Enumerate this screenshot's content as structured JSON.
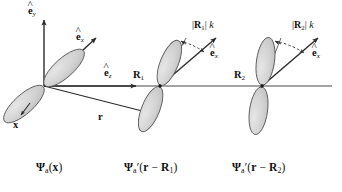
{
  "figure": {
    "background_color": "#ffffff",
    "lobe_fill_color": "#d4d4d4",
    "lobe_stroke_color": "#555555",
    "axis_color": "#4a4a4a",
    "text_color": "#111111"
  },
  "panels": [
    {
      "id": "panel-origin",
      "caption_psi": "Ψ",
      "caption_sub": "a",
      "caption_prime": "",
      "caption_arg": "(x)",
      "caption_full": "Ψa(x)",
      "origin_label": "",
      "orbital_tilt_deg": 42,
      "vectors": [
        {
          "name": "e-hat-y",
          "label_base": "e",
          "label_sub": "y",
          "hat": true
        },
        {
          "name": "e-hat-x",
          "label_base": "e",
          "label_sub": "x",
          "hat": true
        },
        {
          "name": "e-hat-z",
          "label_base": "e",
          "label_sub": "z",
          "hat": true
        },
        {
          "name": "r-vector",
          "label_base": "r",
          "label_sub": "",
          "hat": false
        }
      ],
      "point_labels": [
        {
          "name": "x-point",
          "text": "x"
        }
      ]
    },
    {
      "id": "panel-R1",
      "caption_psi": "Ψ",
      "caption_sub": "a",
      "caption_prime": "′",
      "caption_arg": "(r − R1)",
      "caption_full": "Ψ′a(r − R1)",
      "origin_label": "R",
      "origin_sub": "1",
      "orbital_tilt_deg": 22,
      "annotation": {
        "magnitude": "|R1|",
        "wavevector": "k",
        "display": "|R1| k"
      },
      "vectors": [
        {
          "name": "e-hat-x",
          "label_base": "e",
          "label_sub": "x",
          "hat": true
        }
      ]
    },
    {
      "id": "panel-R2",
      "caption_psi": "Ψ",
      "caption_sub": "a",
      "caption_prime": "′",
      "caption_arg": "(r − R2)",
      "caption_full": "Ψ′a(r − R2)",
      "origin_label": "R",
      "origin_sub": "2",
      "orbital_tilt_deg": 8,
      "annotation": {
        "magnitude": "|R2|",
        "wavevector": "k",
        "display": "|R2| k"
      },
      "vectors": [
        {
          "name": "e-hat-x",
          "label_base": "e",
          "label_sub": "x",
          "hat": true
        }
      ]
    }
  ],
  "labels": {
    "e_base": "e",
    "sub_x": "x",
    "sub_y": "y",
    "sub_z": "z",
    "r_vector": "r",
    "x_point": "x",
    "R_base": "R",
    "sub_1": "1",
    "sub_2": "2",
    "k_symbol": "k",
    "bar": "|",
    "psi": "Ψ",
    "psi_sub": "a",
    "prime": "′",
    "minus": "−",
    "paren_open": "(",
    "paren_close": ")"
  },
  "captions": {
    "left": {
      "psi": "Ψ",
      "sub": "a",
      "prime": "",
      "open": "(",
      "arg": "x",
      "close": ")"
    },
    "middle": {
      "psi": "Ψ",
      "sub": "a",
      "prime": "′",
      "open": "(",
      "arg_r": "r",
      "minus": "−",
      "arg_R": "R",
      "arg_R_sub": "1",
      "close": ")"
    },
    "right": {
      "psi": "Ψ",
      "sub": "a",
      "prime": "′",
      "open": "(",
      "arg_r": "r",
      "minus": "−",
      "arg_R": "R",
      "arg_R_sub": "2",
      "close": ")"
    }
  }
}
